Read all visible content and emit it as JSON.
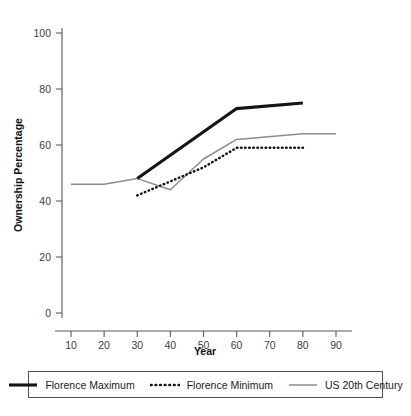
{
  "chart_data": {
    "type": "line",
    "title": "",
    "xlabel": "Year",
    "ylabel": "Ownership Percentage",
    "xlim": [
      5,
      95
    ],
    "ylim": [
      0,
      105
    ],
    "xticks": [
      10,
      20,
      30,
      40,
      50,
      60,
      70,
      80,
      90
    ],
    "xtick_labels": [
      "10",
      "20",
      "30",
      "40",
      "50",
      "60",
      "70",
      "80",
      "90"
    ],
    "yticks": [
      0,
      20,
      40,
      60,
      80,
      100
    ],
    "ytick_labels": [
      "0",
      "20",
      "40",
      "60",
      "80",
      "100"
    ],
    "grid": false,
    "legend_position": "bottom",
    "series": [
      {
        "name": "Florence Maximum",
        "style": "solid-thick",
        "color": "#141414",
        "x": [
          30,
          60,
          80
        ],
        "values": [
          48,
          73,
          75
        ]
      },
      {
        "name": "Florence Minimum",
        "style": "dotted",
        "color": "#141414",
        "x": [
          30,
          40,
          50,
          60,
          80
        ],
        "values": [
          42,
          47,
          52,
          59,
          59
        ]
      },
      {
        "name": "US 20th Century",
        "style": "solid-thin",
        "color": "#8c8c8c",
        "x": [
          10,
          20,
          30,
          40,
          50,
          60,
          80,
          90
        ],
        "values": [
          46,
          46,
          48,
          44,
          55,
          62,
          64,
          64
        ]
      }
    ]
  },
  "legend": {
    "items": [
      {
        "label": "Florence Maximum",
        "swatch": "thick-solid-black-line"
      },
      {
        "label": "Florence Minimum",
        "swatch": "dotted-black-line"
      },
      {
        "label": "US 20th Century",
        "swatch": "thin-solid-gray-line"
      }
    ]
  },
  "axes": {
    "x_title": "Year",
    "y_title": "Ownership Percentage"
  }
}
